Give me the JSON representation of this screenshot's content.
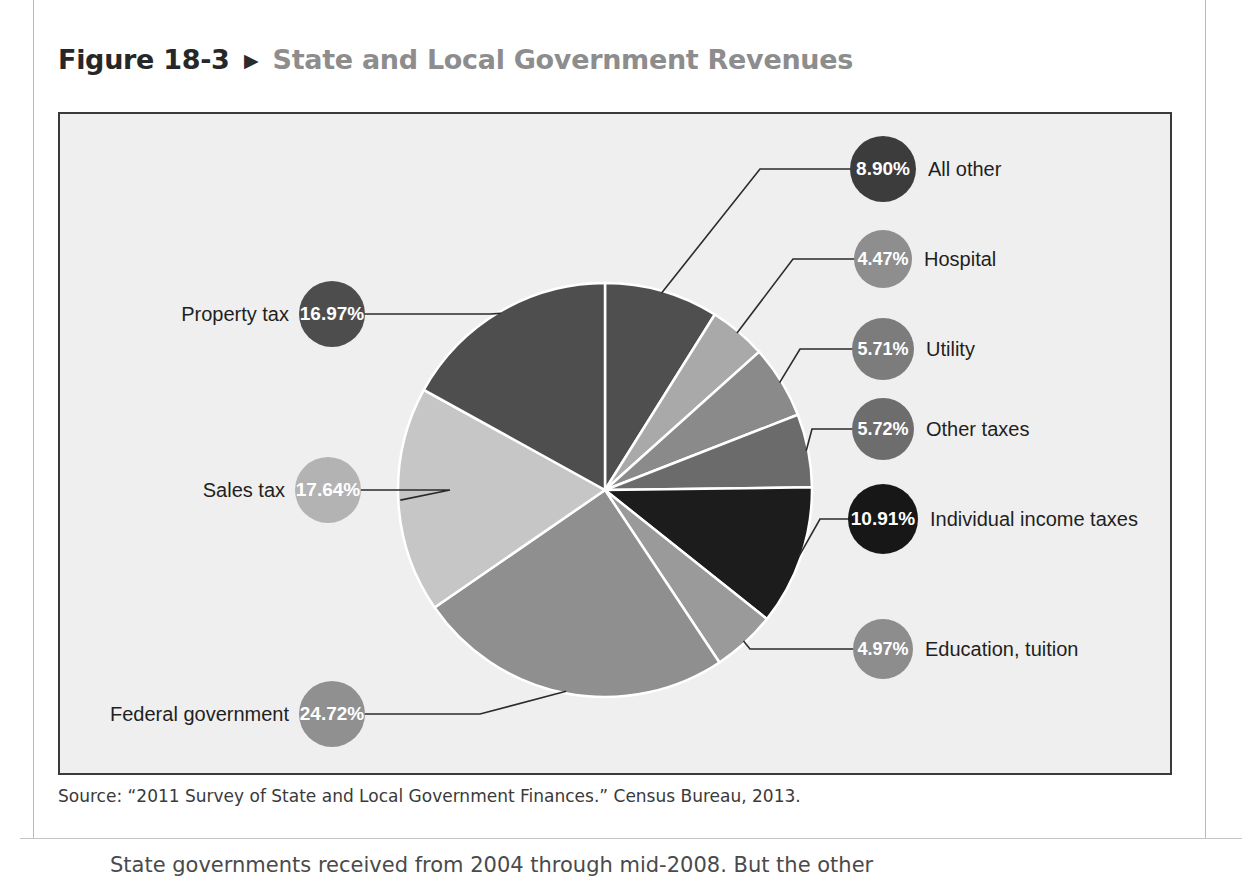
{
  "figure": {
    "number": "Figure 18-3",
    "arrow": "▶",
    "title": "State and Local Government Revenues",
    "source": "Source: “2011 Survey of State and Local Government Finances.” Census Bureau, 2013."
  },
  "page": {
    "body_text_clipped": "State governments received from 2004 through mid-2008. But the other"
  },
  "colors": {
    "frame_border": "#3a3a3a",
    "chart_background": "#efefef",
    "title_number": "#272727",
    "title_name": "#8d8d8d",
    "leader_line": "#2b2b2b",
    "slice_divider": "#ffffff"
  },
  "chart_data": {
    "type": "pie",
    "title": "State and Local Government Revenues",
    "xlabel": "",
    "ylabel": "",
    "units": "percent",
    "start_angle_deg": 0,
    "direction": "clockwise",
    "total": 100.01,
    "legend_position": "callouts",
    "grid": false,
    "categories": [
      "All other",
      "Hospital",
      "Utility",
      "Other taxes",
      "Individual income taxes",
      "Education, tuition",
      "Federal government",
      "Sales tax",
      "Property tax"
    ],
    "values": [
      8.9,
      4.47,
      5.71,
      5.72,
      10.91,
      4.97,
      24.72,
      17.64,
      16.97
    ],
    "value_labels": [
      "8.90%",
      "4.47%",
      "5.71%",
      "5.72%",
      "10.91%",
      "4.97%",
      "24.72%",
      "17.64%",
      "16.97%"
    ],
    "slice_colors": [
      "#4f4f4f",
      "#a9a9a9",
      "#8a8a8a",
      "#6b6b6b",
      "#1c1c1c",
      "#9a9a9a",
      "#8f8f8f",
      "#c6c6c6",
      "#4e4e4e"
    ]
  },
  "callouts": [
    {
      "label": "All other",
      "value": "8.90%",
      "color": "#3c3c3c",
      "side": "right"
    },
    {
      "label": "Hospital",
      "value": "4.47%",
      "color": "#8e8e8e",
      "side": "right"
    },
    {
      "label": "Utility",
      "value": "5.71%",
      "color": "#7c7c7c",
      "side": "right"
    },
    {
      "label": "Other taxes",
      "value": "5.72%",
      "color": "#6d6d6d",
      "side": "right"
    },
    {
      "label": "Individual income taxes",
      "value": "10.91%",
      "color": "#171717",
      "side": "right"
    },
    {
      "label": "Education, tuition",
      "value": "4.97%",
      "color": "#8d8d8d",
      "side": "right"
    },
    {
      "label": "Federal government",
      "value": "24.72%",
      "color": "#909090",
      "side": "left"
    },
    {
      "label": "Sales tax",
      "value": "17.64%",
      "color": "#b3b3b3",
      "side": "left"
    },
    {
      "label": "Property tax",
      "value": "16.97%",
      "color": "#4d4d4d",
      "side": "left"
    }
  ]
}
